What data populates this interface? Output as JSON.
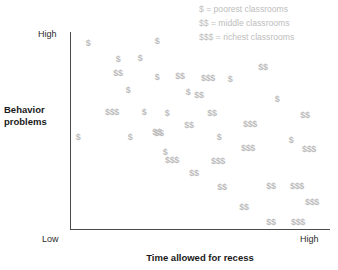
{
  "chart_data": {
    "type": "scatter",
    "title": "",
    "xlabel": "Time allowed for recess",
    "ylabel": "Behavior problems",
    "xlim": [
      "Low",
      "High"
    ],
    "ylim": [
      "Low",
      "High"
    ],
    "grid": false,
    "legend_position": "top-right",
    "x_ticks": [
      "Low",
      "High"
    ],
    "y_ticks": [
      "High"
    ],
    "marker_style": "dollar-sign-glyph",
    "marker_color": "#bcbcbc",
    "series": [
      {
        "name": "$",
        "legend_label": "$ = poorest classrooms",
        "points": [
          {
            "x": 88,
            "y": 43
          },
          {
            "x": 157,
            "y": 41
          },
          {
            "x": 118,
            "y": 59
          },
          {
            "x": 140,
            "y": 58
          },
          {
            "x": 157,
            "y": 77
          },
          {
            "x": 128,
            "y": 90
          },
          {
            "x": 188,
            "y": 92
          },
          {
            "x": 230,
            "y": 79
          },
          {
            "x": 144,
            "y": 112
          },
          {
            "x": 167,
            "y": 113
          },
          {
            "x": 277,
            "y": 99
          },
          {
            "x": 78,
            "y": 137
          },
          {
            "x": 130,
            "y": 137
          },
          {
            "x": 219,
            "y": 137
          },
          {
            "x": 165,
            "y": 152
          },
          {
            "x": 291,
            "y": 140
          }
        ]
      },
      {
        "name": "$$",
        "legend_label": "$$ = middle classrooms",
        "points": [
          {
            "x": 118,
            "y": 73
          },
          {
            "x": 180,
            "y": 76
          },
          {
            "x": 263,
            "y": 67
          },
          {
            "x": 199,
            "y": 95
          },
          {
            "x": 159,
            "y": 133
          },
          {
            "x": 212,
            "y": 113
          },
          {
            "x": 189,
            "y": 125
          },
          {
            "x": 305,
            "y": 115
          },
          {
            "x": 157,
            "y": 132
          },
          {
            "x": 194,
            "y": 173
          },
          {
            "x": 222,
            "y": 187
          },
          {
            "x": 271,
            "y": 186
          },
          {
            "x": 244,
            "y": 207
          },
          {
            "x": 271,
            "y": 222
          }
        ]
      },
      {
        "name": "$$$",
        "legend_label": "$$$ = richest classrooms",
        "points": [
          {
            "x": 208,
            "y": 78
          },
          {
            "x": 112,
            "y": 112
          },
          {
            "x": 250,
            "y": 124
          },
          {
            "x": 248,
            "y": 148
          },
          {
            "x": 309,
            "y": 149
          },
          {
            "x": 172,
            "y": 160
          },
          {
            "x": 218,
            "y": 161
          },
          {
            "x": 297,
            "y": 186
          },
          {
            "x": 312,
            "y": 202
          },
          {
            "x": 298,
            "y": 222
          }
        ]
      }
    ]
  },
  "legend": {
    "rows": [
      "$ = poorest classrooms",
      "$$ = middle classrooms",
      "$$$ = richest classrooms"
    ]
  },
  "axes": {
    "y_title_line1": "Behavior",
    "y_title_line2": "problems",
    "x_title": "Time allowed for recess",
    "y_tick_high": "High",
    "x_tick_low": "Low",
    "x_tick_high": "High"
  }
}
